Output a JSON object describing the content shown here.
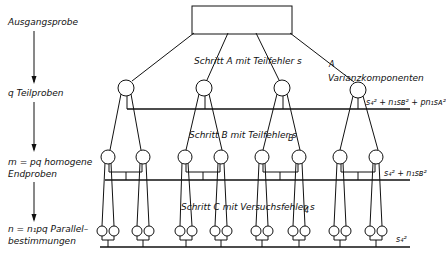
{
  "levels": [
    {
      "label": "Ausgangsprobe"
    },
    {
      "label": "q Teilproben"
    },
    {
      "label_line1": "m = pq homogene",
      "label_line2": "Endproben"
    },
    {
      "label_line1": "n = n₁pq Parallel–",
      "label_line2": "bestimmungen"
    }
  ],
  "steps": {
    "a": "Schritt A mit Teilfehler s",
    "a_sub": "A",
    "b": "Schritt B mit Teilfehler s",
    "b_sub": "B",
    "c": "Schritt C mit Versuchsfehler s",
    "c_sub": "4"
  },
  "variance": {
    "title": "Varianzkomponenten",
    "level1": "s₄² + n₁sʙ² + pn₁sᴀ²",
    "level2": "s₄² + n₁sʙ²",
    "level3": "s₄²"
  }
}
